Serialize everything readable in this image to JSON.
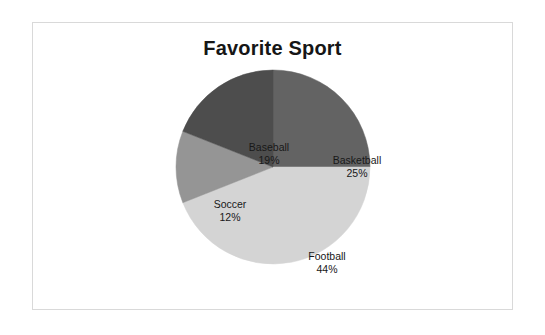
{
  "chart_data": {
    "type": "pie",
    "title": "Favorite Sport",
    "categories": [
      "Basketball",
      "Football",
      "Soccer",
      "Baseball"
    ],
    "values": [
      25,
      44,
      12,
      19
    ],
    "unit": "%",
    "labels": [
      {
        "name": "Basketball",
        "value": "25%",
        "color": "#636363",
        "start_angle": 0,
        "end_angle": 90
      },
      {
        "name": "Football",
        "value": "44%",
        "color": "#d4d4d4",
        "start_angle": 90,
        "end_angle": 248.4
      },
      {
        "name": "Soccer",
        "value": "12%",
        "color": "#959595",
        "start_angle": 248.4,
        "end_angle": 291.6
      },
      {
        "name": "Baseball",
        "value": "19%",
        "color": "#4d4d4d",
        "start_angle": 291.6,
        "end_angle": 360
      }
    ],
    "legend": "none",
    "data_labels": "category name and percentage inside slices",
    "start_angle_deg": 0,
    "direction": "clockwise",
    "frame_border_color": "#d9d9d9",
    "background_color": "#ffffff"
  }
}
